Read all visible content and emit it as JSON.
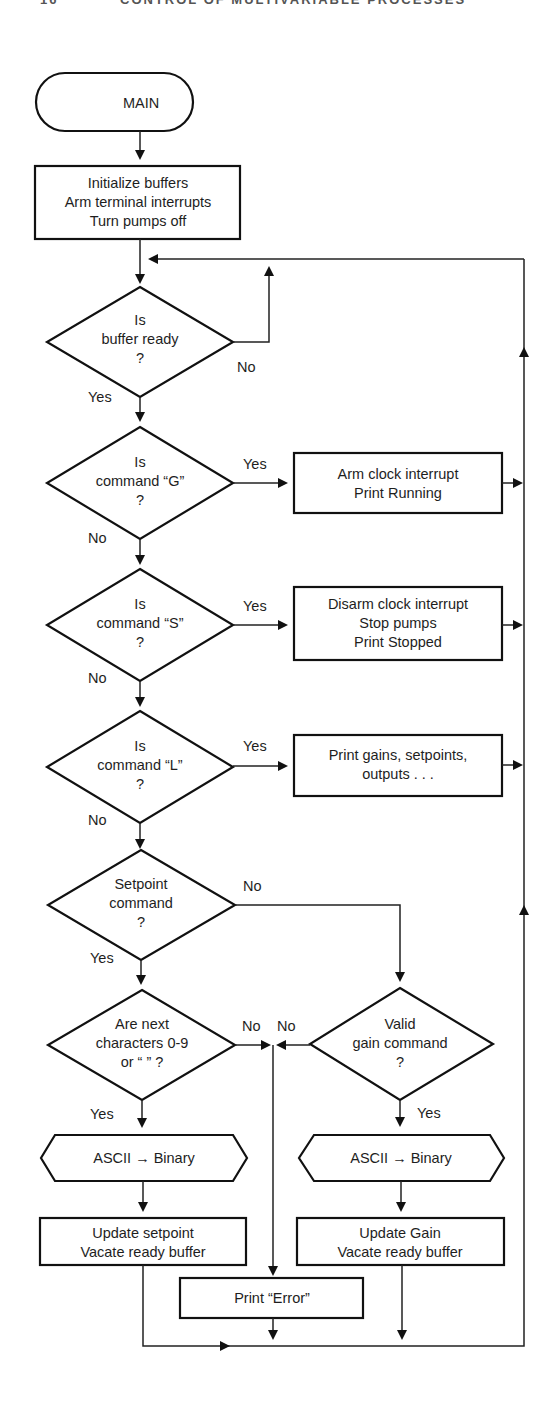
{
  "page_header": {
    "page_number": "16",
    "running_title": "CONTROL OF MULTIVARIABLE PROCESSES"
  },
  "flowchart": {
    "start": {
      "label": "MAIN"
    },
    "init": {
      "lines": [
        "Initialize buffers",
        "Arm terminal interrupts",
        "Turn pumps off"
      ]
    },
    "buffer_ready": {
      "lines": [
        "Is",
        "buffer ready",
        "?"
      ],
      "no_label": "No",
      "yes_label": "Yes"
    },
    "cmd_g": {
      "lines": [
        "Is",
        "command “G”",
        "?"
      ],
      "yes_label": "Yes",
      "no_label": "No"
    },
    "cmd_g_action": {
      "lines": [
        "Arm clock interrupt",
        "Print Running"
      ]
    },
    "cmd_s": {
      "lines": [
        "Is",
        "command “S”",
        "?"
      ],
      "yes_label": "Yes",
      "no_label": "No"
    },
    "cmd_s_action": {
      "lines": [
        "Disarm clock interrupt",
        "Stop pumps",
        "Print Stopped"
      ]
    },
    "cmd_l": {
      "lines": [
        "Is",
        "command “L”",
        "?"
      ],
      "yes_label": "Yes",
      "no_label": "No"
    },
    "cmd_l_action": {
      "lines": [
        "Print gains, setpoints,",
        "outputs . . ."
      ]
    },
    "setpoint_cmd": {
      "lines": [
        "Setpoint",
        "command",
        "?"
      ],
      "no_label": "No",
      "yes_label": "Yes"
    },
    "next_chars": {
      "lines": [
        "Are next",
        "characters 0-9",
        "or “   ” ?"
      ],
      "no_label": "No",
      "yes_label": "Yes"
    },
    "valid_gain": {
      "lines": [
        "Valid",
        "gain command",
        "?"
      ],
      "no_label": "No",
      "yes_label": "Yes"
    },
    "ascii_left": {
      "label": "ASCII → Binary"
    },
    "ascii_right": {
      "label": "ASCII → Binary"
    },
    "update_setpoint": {
      "lines": [
        "Update setpoint",
        "Vacate ready buffer"
      ]
    },
    "update_gain": {
      "lines": [
        "Update Gain",
        "Vacate ready buffer"
      ]
    },
    "print_error": {
      "label": "Print “Error”"
    }
  },
  "colors": {
    "stroke": "#111111",
    "text": "#1e1e1e",
    "background": "#ffffff"
  }
}
